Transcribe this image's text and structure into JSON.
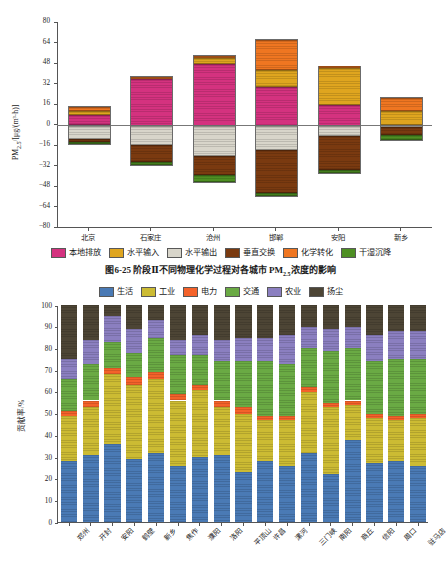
{
  "top": {
    "caption": "图6-25  阶段Ⅱ不同物理化学过程对各城市 PM",
    "caption_sub": "2.5",
    "caption_tail": "浓度的影响",
    "ylabel_main": "PM",
    "ylabel_sub": "2.5",
    "ylabel_unit": "/[μg/(m³·h)]",
    "legend": [
      {
        "label": "本地排放",
        "color": "#d4327f"
      },
      {
        "label": "水平输入",
        "color": "#dfa51f"
      },
      {
        "label": "水平输出",
        "color": "#d8d5ca"
      },
      {
        "label": "垂直交换",
        "color": "#7a3a10"
      },
      {
        "label": "化学转化",
        "color": "#ef7621"
      },
      {
        "label": "干湿沉降",
        "color": "#4e8f23"
      }
    ],
    "chart_data": {
      "type": "bar",
      "title": "阶段Ⅱ不同物理化学过程对各城市 PM2.5 浓度的影响",
      "xlabel": "",
      "ylabel": "PM2.5/[μg/(m³·h)]",
      "ylim": [
        -80,
        80
      ],
      "yticks": [
        80,
        64,
        48,
        32,
        16,
        0,
        -16,
        -32,
        -48,
        -64,
        -80
      ],
      "grid": false,
      "legend_position": "bottom",
      "stacked": true,
      "categories": [
        "北京",
        "石家庄",
        "沧州",
        "邯郸",
        "安阳",
        "新乡"
      ],
      "series": [
        {
          "name": "本地排放",
          "color": "#d4327f",
          "values": [
            8.5,
            36.0,
            48.0,
            30.0,
            16.0,
            0.6
          ]
        },
        {
          "name": "水平输入",
          "color": "#dfa51f",
          "values": [
            3.2,
            0.0,
            4.5,
            13.5,
            28.5,
            10.5
          ]
        },
        {
          "name": "化学转化",
          "color": "#ef7621",
          "values": [
            2.5,
            1.5,
            1.5,
            23.0,
            1.0,
            10.5
          ]
        },
        {
          "name": "水平输出",
          "color": "#d8d5ca",
          "values": [
            -10.5,
            -15.5,
            -24.0,
            -19.5,
            -8.0,
            -1.5
          ]
        },
        {
          "name": "垂直交换",
          "color": "#7a3a10",
          "values": [
            -2.5,
            -13.0,
            -15.0,
            -33.5,
            -26.5,
            -6.0
          ]
        },
        {
          "name": "干湿沉降",
          "color": "#4e8f23",
          "values": [
            -1.5,
            -2.0,
            -5.0,
            -2.0,
            -2.5,
            -3.5
          ]
        }
      ],
      "bar_totals_positive": [
        14.2,
        37.5,
        54.0,
        66.5,
        45.5,
        21.6
      ],
      "bar_totals_negative": [
        -14.5,
        -30.5,
        -44.0,
        -55.0,
        -37.0,
        -11.0
      ]
    }
  },
  "bottom": {
    "ylabel_main": "贡献率",
    "ylabel_unit": "/%",
    "legend": [
      {
        "label": "生活",
        "color": "#4a7ab5"
      },
      {
        "label": "工业",
        "color": "#ccbb33"
      },
      {
        "label": "电力",
        "color": "#f4622a"
      },
      {
        "label": "交通",
        "color": "#6aaa44"
      },
      {
        "label": "农业",
        "color": "#8b7fc0"
      },
      {
        "label": "扬尘",
        "color": "#4d4535"
      }
    ],
    "chart_data": {
      "type": "bar",
      "stacked": true,
      "title": "",
      "xlabel": "",
      "ylabel": "贡献率/%",
      "ylim": [
        0,
        100
      ],
      "yticks": [
        0,
        10,
        20,
        30,
        40,
        50,
        60,
        70,
        80,
        90,
        100
      ],
      "grid": false,
      "legend_position": "top",
      "categories": [
        "郑州",
        "开封",
        "安阳",
        "鹤壁",
        "新乡",
        "焦作",
        "濮阳",
        "洛阳",
        "平顶山",
        "许昌",
        "漯河",
        "三门峡",
        "南阳",
        "商丘",
        "信阳",
        "周口",
        "驻马店"
      ],
      "series": [
        {
          "name": "生活",
          "color": "#4a7ab5",
          "values": [
            28,
            31,
            36,
            29,
            32,
            26,
            30,
            31,
            23,
            28,
            26,
            32,
            22,
            38,
            27,
            28,
            26
          ]
        },
        {
          "name": "工业",
          "color": "#ccbb33",
          "values": [
            21,
            22,
            32,
            34,
            34,
            30,
            31,
            22,
            27,
            19,
            21,
            28,
            31,
            16,
            21,
            19,
            22
          ]
        },
        {
          "name": "电力",
          "color": "#f4622a",
          "values": [
            2,
            3,
            3,
            4,
            3,
            3,
            2,
            3,
            3,
            2,
            2,
            2,
            2,
            2,
            2,
            2,
            2
          ]
        },
        {
          "name": "交通",
          "color": "#6aaa44",
          "values": [
            15,
            17,
            12,
            11,
            16,
            18,
            14,
            18,
            21,
            25,
            24,
            18,
            24,
            24,
            24,
            26,
            25
          ]
        },
        {
          "name": "农业",
          "color": "#8b7fc0",
          "values": [
            9,
            11,
            12,
            11,
            8,
            7,
            9,
            10,
            11,
            11,
            13,
            10,
            10,
            10,
            12,
            13,
            13
          ]
        },
        {
          "name": "扬尘",
          "color": "#4d4535",
          "values": [
            25,
            16,
            5,
            11,
            7,
            16,
            14,
            16,
            15,
            15,
            14,
            10,
            11,
            10,
            14,
            12,
            12
          ]
        }
      ]
    }
  }
}
